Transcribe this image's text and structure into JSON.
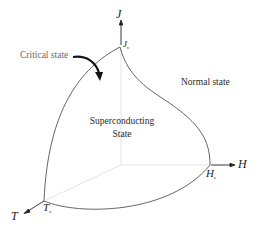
{
  "diagram": {
    "type": "3d-phase-diagram",
    "axes": {
      "j": {
        "label": "J"
      },
      "h": {
        "label": "H"
      },
      "t": {
        "label": "T"
      }
    },
    "critical_points": {
      "jc": {
        "main": "J",
        "sub": "c"
      },
      "hc": {
        "main": "H",
        "sub": "c"
      },
      "tc": {
        "main": "T",
        "sub": "c"
      }
    },
    "labels": {
      "critical_state": "Critical state",
      "normal_state": "Normal state",
      "superconducting_line1": "Superconducting",
      "superconducting_line2": "State"
    },
    "colors": {
      "curve": "#555555",
      "axis_faint": "#d8d8d8",
      "arrow": "#111111",
      "text": "#222222",
      "text_gray": "#6a6a6a"
    }
  }
}
